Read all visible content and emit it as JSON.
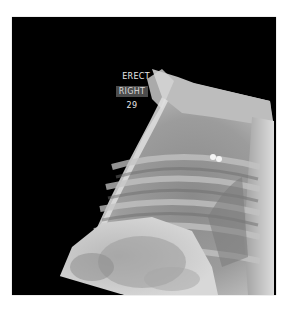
{
  "image": {
    "type": "lateral chest radiograph",
    "background": "#ffffff",
    "film_color": "#000000"
  },
  "overlay_labels": {
    "position": "ERECT",
    "side": "RIGHT",
    "number": "29"
  },
  "colors": {
    "label_text": "#e8e8e8",
    "side_label_bg": "#4c4c4c"
  }
}
